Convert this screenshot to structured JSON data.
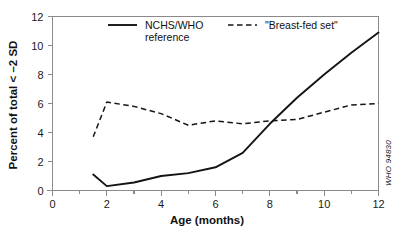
{
  "chart_data": {
    "type": "line",
    "title": "",
    "xlabel": "Age (months)",
    "ylabel": "Percent of total < –2 SD",
    "xlim": [
      0,
      12
    ],
    "ylim": [
      0,
      12
    ],
    "xticks": [
      0,
      2,
      4,
      6,
      8,
      10,
      12
    ],
    "xtick_labels": [
      "0",
      "2",
      "4",
      "6",
      "8",
      "10",
      "12"
    ],
    "xminor_ticks": [
      1,
      3,
      5,
      7,
      9,
      11
    ],
    "yticks": [
      0,
      2,
      4,
      6,
      8,
      10,
      12
    ],
    "ytick_labels": [
      "0",
      "2",
      "4",
      "6",
      "8",
      "10",
      "12"
    ],
    "grid": false,
    "legend_position": "top-inside",
    "series": [
      {
        "name": "NCHS/WHO reference",
        "style": "solid",
        "color": "#141414",
        "x": [
          1.5,
          2.0,
          3.0,
          4.0,
          5.0,
          6.0,
          7.0,
          8.0,
          9.0,
          10.0,
          11.0,
          12.0
        ],
        "values": [
          1.1,
          0.3,
          0.55,
          1.0,
          1.2,
          1.6,
          2.6,
          4.6,
          6.4,
          8.0,
          9.5,
          10.9
        ]
      },
      {
        "name": "\"Breast-fed set\"",
        "style": "dashed",
        "color": "#141414",
        "x": [
          1.5,
          2.0,
          3.0,
          4.0,
          5.0,
          6.0,
          7.0,
          8.0,
          9.0,
          10.0,
          11.0,
          12.0
        ],
        "values": [
          3.7,
          6.1,
          5.8,
          5.3,
          4.5,
          4.8,
          4.6,
          4.8,
          4.9,
          5.4,
          5.9,
          6.0
        ]
      }
    ]
  },
  "legend": {
    "entries": [
      {
        "label_line1": "NCHS/WHO",
        "label_line2": "reference",
        "style": "solid"
      },
      {
        "label_line1": "\"Breast-fed set\"",
        "label_line2": "",
        "style": "dashed"
      }
    ]
  },
  "credit": {
    "text": "WHO 94830"
  }
}
